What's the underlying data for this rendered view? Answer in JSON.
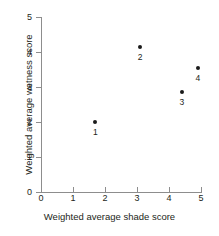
{
  "chart_data": {
    "type": "scatter",
    "title": "",
    "xlabel": "Weighted average shade score",
    "ylabel": "Weighted average wetness score",
    "xlim": [
      0,
      5
    ],
    "ylim": [
      0,
      5
    ],
    "xticks": [
      "0",
      "1",
      "2",
      "3",
      "4",
      "5"
    ],
    "yticks": [
      "0",
      "1",
      "2",
      "3",
      "4",
      "5"
    ],
    "grid": false,
    "legend": "none",
    "marker_color": "#1a1a1a",
    "axis_color": "#8d8d8d",
    "points": [
      {
        "label": "1",
        "x": 1.7,
        "y": 2.0
      },
      {
        "label": "2",
        "x": 3.1,
        "y": 4.15
      },
      {
        "label": "3",
        "x": 4.4,
        "y": 2.85
      },
      {
        "label": "4",
        "x": 4.9,
        "y": 3.55
      }
    ]
  }
}
